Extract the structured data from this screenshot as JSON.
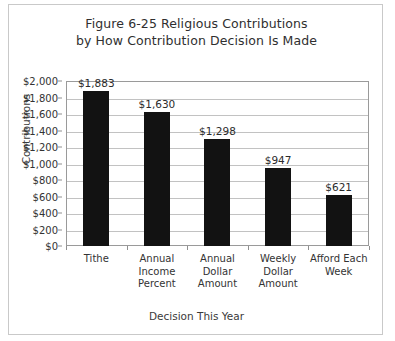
{
  "figure": {
    "title_lines": [
      "Figure 6-25 Religious Contributions",
      "by How Contribution Decision Is Made"
    ],
    "xlabel": "Decision This Year",
    "ylabel": "Contributions"
  },
  "chart_data": {
    "type": "bar",
    "title": "Figure 6-25 Religious Contributions by How Contribution Decision Is Made",
    "xlabel": "Decision This Year",
    "ylabel": "Contributions",
    "categories": [
      "Tithe",
      "Annual Income Percent",
      "Annual Dollar Amount",
      "Weekly Dollar Amount",
      "Afford Each Week"
    ],
    "category_lines": [
      [
        "Tithe"
      ],
      [
        "Annual",
        "Income",
        "Percent"
      ],
      [
        "Annual",
        "Dollar",
        "Amount"
      ],
      [
        "Weekly",
        "Dollar",
        "Amount"
      ],
      [
        "Afford Each",
        "Week"
      ]
    ],
    "values": [
      1883,
      1630,
      1298,
      947,
      621
    ],
    "value_labels": [
      "$1,883",
      "$1,630",
      "$1,298",
      "$947",
      "$621"
    ],
    "ylim": [
      0,
      2000
    ],
    "ytick_values": [
      0,
      200,
      400,
      600,
      800,
      1000,
      1200,
      1400,
      1600,
      1800,
      2000
    ],
    "ytick_labels": [
      "$0",
      "$200",
      "$400",
      "$600",
      "$800",
      "$1,000",
      "$1,200",
      "$1,400",
      "$1,600",
      "$1,800",
      "$2,000"
    ],
    "grid": true,
    "grid_axis": "y",
    "legend": false,
    "bar_color": "#121212",
    "gridline_color": "#c2c2c2",
    "axis_color": "#9a9a9a",
    "background_color": "#ffffff"
  }
}
